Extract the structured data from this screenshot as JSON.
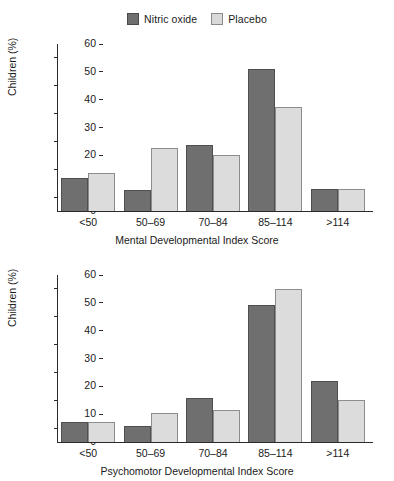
{
  "legend": {
    "items": [
      {
        "label": "Nitric oxide",
        "color": "#6f6f6f",
        "icon": "square-filled-dark-icon"
      },
      {
        "label": "Placebo",
        "color": "#dcdcdc",
        "icon": "square-filled-light-icon"
      }
    ]
  },
  "chart_data": [
    {
      "type": "bar",
      "title": "",
      "xlabel": "Mental Developmental Index Score",
      "ylabel": "Children (%)",
      "categories": [
        "<50",
        "50–69",
        "70–84",
        "85–114",
        ">114"
      ],
      "series": [
        {
          "name": "Nitric oxide",
          "color": "#6f6f6f",
          "values": [
            12.0,
            7.7,
            23.6,
            51.0,
            8.0
          ]
        },
        {
          "name": "Placebo",
          "color": "#dcdcdc",
          "values": [
            13.7,
            22.7,
            20.0,
            37.5,
            8.0
          ]
        }
      ],
      "ylim": [
        0,
        60
      ],
      "yticks": [
        0,
        10,
        20,
        30,
        40,
        50,
        60
      ],
      "grid": false,
      "legend_position": "top-center"
    },
    {
      "type": "bar",
      "title": "",
      "xlabel": "Psychomotor Developmental Index Score",
      "ylabel": "Children (%)",
      "categories": [
        "<50",
        "50–69",
        "70–84",
        "85–114",
        ">114"
      ],
      "series": [
        {
          "name": "Nitric oxide",
          "color": "#6f6f6f",
          "values": [
            7.1,
            5.8,
            15.8,
            49.2,
            22.0
          ]
        },
        {
          "name": "Placebo",
          "color": "#dcdcdc",
          "values": [
            7.1,
            10.3,
            11.6,
            55.0,
            15.0
          ]
        }
      ],
      "ylim": [
        0,
        60
      ],
      "yticks": [
        0,
        10,
        20,
        30,
        40,
        50,
        60
      ],
      "grid": false,
      "legend_position": "top-center"
    }
  ]
}
